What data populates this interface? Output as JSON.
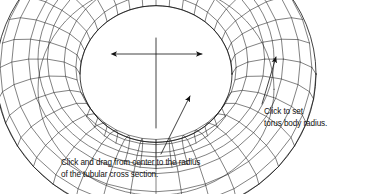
{
  "figure": {
    "background_color": "#ffffff",
    "line_color": "#111111",
    "object": "torus-wireframe"
  },
  "geometry": {
    "type": "torus",
    "center_x": 156,
    "center_y": 74,
    "major_radius": 118,
    "minor_radius": 42,
    "tilt_degrees": 68,
    "major_segments": 36,
    "minor_segments": 14
  },
  "callouts": [
    {
      "id": "body-radius",
      "lines": [
        "Click to set",
        "torus body radius."
      ],
      "line1": "Click to set",
      "line2": "torus body radius.",
      "leader_from_x": 262,
      "leader_from_y": 104,
      "leader_to_x": 276,
      "leader_to_y": 57,
      "arrow": "up-right"
    },
    {
      "id": "tube-radius",
      "lines": [
        "Click and drag from center to the radius",
        "of the tubular cross section."
      ],
      "line1": "Click and drag from center to the radius",
      "line2": "of the tubular cross section.",
      "leader_from_x": 161,
      "leader_from_y": 154,
      "leader_to_x": 190,
      "leader_to_y": 96,
      "arrow": "up-right"
    }
  ],
  "measure_arrows": [
    {
      "id": "body-radius-span",
      "x1": 116,
      "y1": 54,
      "x2": 202,
      "y2": 54,
      "double_headed": true
    },
    {
      "id": "center-axis",
      "x1": 156,
      "y1": 38,
      "x2": 156,
      "y2": 128,
      "double_headed": false
    }
  ]
}
